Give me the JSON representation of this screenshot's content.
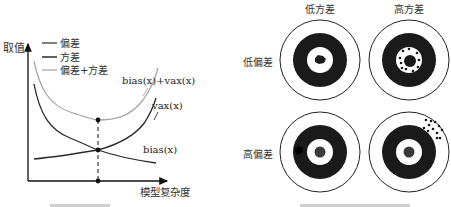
{
  "left_chart": {
    "y_axis_label": "取值",
    "x_axis_label": "模型复杂度",
    "legend": [
      {
        "label": "偏差",
        "color": "#2a2a2a"
      },
      {
        "label": "方差",
        "color": "#1a1a1a"
      },
      {
        "label": "偏差+方差",
        "color": "#a0a0a0"
      }
    ],
    "curve_labels": {
      "total": "bias(x)+vax(x)",
      "variance": "vax(x)",
      "bias": "bias(x)"
    },
    "colors": {
      "axis": "#111111",
      "bias": "#2a2a2a",
      "variance": "#2a2a2a",
      "total": "#a8a8a8",
      "optimal_line": "#111111"
    }
  },
  "right_diagram": {
    "column_labels": [
      "低方差",
      "高方差"
    ],
    "row_labels": [
      "低偏差",
      "高偏差"
    ],
    "targets": [
      {
        "row": 0,
        "col": 0,
        "description": "low bias, low variance"
      },
      {
        "row": 0,
        "col": 1,
        "description": "low bias, high variance"
      },
      {
        "row": 1,
        "col": 0,
        "description": "high bias, low variance"
      },
      {
        "row": 1,
        "col": 1,
        "description": "high bias, high variance"
      }
    ],
    "colors": {
      "ring": "#1a1a1a",
      "background": "#ffffff"
    }
  }
}
